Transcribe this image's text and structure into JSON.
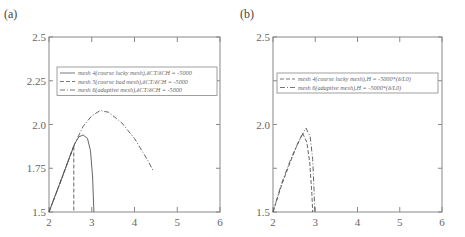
{
  "chart_data": [
    {
      "panel_label": "(a)",
      "type": "line",
      "title": "",
      "xlabel": "",
      "ylabel": "",
      "xlim": [
        2,
        6
      ],
      "ylim": [
        1.5,
        2.5
      ],
      "xticks": [
        "2",
        "3",
        "4",
        "5",
        "6"
      ],
      "yticks": [
        "1.5",
        "1.75",
        "2.0",
        "2.25",
        "2.5"
      ],
      "grid": false,
      "legend_position": "upper center",
      "series": [
        {
          "name": "mesh 4(course lucky mesh),δCT/δCH = -5000",
          "style": "solid",
          "x": [
            2.0,
            2.2,
            2.4,
            2.6,
            2.7,
            2.8,
            2.9,
            2.97,
            3.02,
            3.05
          ],
          "y": [
            1.5,
            1.63,
            1.76,
            1.89,
            1.93,
            1.94,
            1.92,
            1.85,
            1.7,
            1.5
          ]
        },
        {
          "name": "mesh 5(course bad mesh),δCT/δCH = -5000",
          "style": "dashed",
          "x": [
            2.0,
            2.3,
            2.58,
            2.58
          ],
          "y": [
            1.5,
            1.69,
            1.88,
            1.5
          ]
        },
        {
          "name": "mesh 6(adaptive mesh),δCT/δCH = -5000",
          "style": "dashdot",
          "x": [
            2.0,
            2.6,
            2.8,
            3.0,
            3.2,
            3.4,
            3.7,
            4.0,
            4.3,
            4.45
          ],
          "y": [
            1.5,
            1.89,
            1.99,
            2.05,
            2.08,
            2.07,
            2.01,
            1.92,
            1.8,
            1.73
          ]
        }
      ]
    },
    {
      "panel_label": "(b)",
      "type": "line",
      "title": "",
      "xlabel": "",
      "ylabel": "",
      "xlim": [
        2,
        6
      ],
      "ylim": [
        1.5,
        2.5
      ],
      "xticks": [
        "2",
        "3",
        "4",
        "5",
        "6"
      ],
      "yticks": [
        "1.5",
        "2.0",
        "2.5"
      ],
      "grid": false,
      "legend_position": "upper center",
      "series": [
        {
          "name": "mesh 4(course lucky mesh),H = -5000*(δ/L0)",
          "style": "dashed",
          "x": [
            2.0,
            2.2,
            2.4,
            2.55,
            2.7,
            2.8,
            2.87,
            2.92,
            2.94
          ],
          "y": [
            1.5,
            1.65,
            1.78,
            1.87,
            1.95,
            1.9,
            1.78,
            1.6,
            1.5
          ]
        },
        {
          "name": "mesh 6(adaptive mesh),H = -5000*(δ/L0)",
          "style": "dashdot",
          "x": [
            2.0,
            2.2,
            2.4,
            2.6,
            2.78,
            2.88,
            2.94,
            2.97,
            2.99
          ],
          "y": [
            1.5,
            1.66,
            1.79,
            1.9,
            1.98,
            1.93,
            1.8,
            1.63,
            1.5
          ]
        }
      ]
    }
  ],
  "panels": {
    "a": {
      "label": "(a)",
      "legend": [
        "mesh 4(course lucky mesh),δCT/δCH = -5000",
        "mesh 5(course bad mesh),δCT/δCH = -5000",
        "mesh 6(adaptive mesh),δCT/δCH = -5000"
      ]
    },
    "b": {
      "label": "(b)",
      "legend": [
        "mesh 4(course lucky mesh),H = -5000*(δ/L0)",
        "mesh 6(adaptive mesh),H = -5000*(δ/L0)"
      ]
    }
  },
  "colors": {
    "axis": "#888888",
    "line": "#555555",
    "text": "#666666"
  }
}
